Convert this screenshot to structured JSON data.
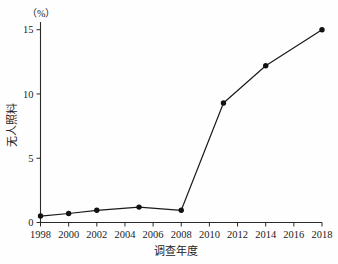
{
  "chart_data": {
    "type": "line",
    "title": "",
    "xlabel": "调查年度",
    "ylabel": "无人照料",
    "yunit": "（%）",
    "x": [
      1998,
      2000,
      2002,
      2005,
      2008,
      2011,
      2014,
      2018
    ],
    "values": [
      0.5,
      0.7,
      0.95,
      1.2,
      0.95,
      9.3,
      12.2,
      15.0
    ],
    "series": [
      {
        "name": "无人照料",
        "values": [
          0.5,
          0.7,
          0.95,
          1.2,
          0.95,
          9.3,
          12.2,
          15.0
        ]
      }
    ],
    "xlim": [
      1998,
      2018
    ],
    "ylim": [
      0,
      15.6
    ],
    "xticks": [
      1998,
      2000,
      2002,
      2004,
      2006,
      2008,
      2010,
      2012,
      2014,
      2016,
      2018
    ],
    "xtick_labels": [
      "1998",
      "2000",
      "2002",
      "2004",
      "2006",
      "2008",
      "2010",
      "2012",
      "2014",
      "2016",
      "2018"
    ],
    "yticks": [
      0,
      5,
      10,
      15
    ],
    "ytick_labels": [
      "0",
      "5",
      "10",
      "15"
    ],
    "grid": false,
    "legend": "none",
    "marker": "filled-circle",
    "line_color": "#1a1a1a",
    "marker_color": "#111111",
    "background_color": "#fefefe"
  }
}
